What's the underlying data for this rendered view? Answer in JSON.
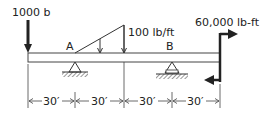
{
  "diagram": {
    "type": "beam-loading",
    "loads": {
      "point_load": {
        "label": "1000 b",
        "direction": "down"
      },
      "distributed_load": {
        "label": "100 lb/ft",
        "shape": "triangular"
      },
      "moment": {
        "label": "60,000 lb-ft"
      }
    },
    "supports": {
      "a": {
        "label": "A",
        "type": "pin"
      },
      "b": {
        "label": "B",
        "type": "roller"
      }
    },
    "dimensions": [
      {
        "label": "30′"
      },
      {
        "label": "30′"
      },
      {
        "label": "30′"
      },
      {
        "label": "30′"
      }
    ],
    "colors": {
      "line": "#333333",
      "heavy": "#222222",
      "beam_fill": "#ffffff"
    }
  }
}
